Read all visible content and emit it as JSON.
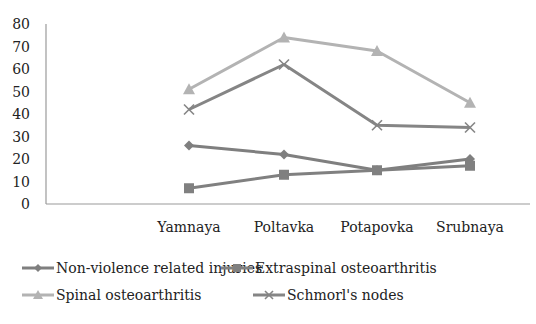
{
  "chart_data": {
    "type": "line",
    "title": "",
    "xlabel": "",
    "ylabel": "",
    "ylim": [
      0,
      80
    ],
    "yticks": [
      0,
      10,
      20,
      30,
      40,
      50,
      60,
      70,
      80
    ],
    "grid": false,
    "legend_position": "bottom",
    "categories": [
      "Yamnaya",
      "Poltavka",
      "Potapovka",
      "Srubnaya"
    ],
    "series": [
      {
        "name": "Non-violence related injuries",
        "marker": "diamond",
        "color": "#7f7f7f",
        "values": [
          26,
          22,
          15,
          20
        ]
      },
      {
        "name": "Extraspinal osteoarthritis",
        "marker": "square",
        "color": "#808080",
        "values": [
          7,
          13,
          15,
          17
        ]
      },
      {
        "name": "Spinal osteoarthritis",
        "marker": "triangle",
        "color": "#b3b3b3",
        "values": [
          51,
          74,
          68,
          45
        ]
      },
      {
        "name": "Schmorl's nodes",
        "marker": "x",
        "color": "#858585",
        "values": [
          42,
          62,
          35,
          34
        ]
      }
    ]
  }
}
